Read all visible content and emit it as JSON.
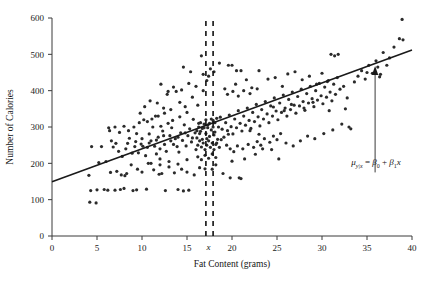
{
  "chart_data": {
    "type": "scatter",
    "title": "",
    "xlabel": "Fat Content (grams)",
    "ylabel": "Number of Calories",
    "xlim": [
      0,
      40
    ],
    "ylim": [
      0,
      600
    ],
    "xticks": [
      0,
      5,
      10,
      15,
      20,
      25,
      30,
      35,
      40
    ],
    "yticks": [
      0,
      100,
      200,
      300,
      400,
      500,
      600
    ],
    "xtick_labels": [
      "0",
      "5",
      "10",
      "15",
      "20",
      "25",
      "30",
      "35",
      "40"
    ],
    "ytick_labels": [
      "0",
      "100",
      "200",
      "300",
      "400",
      "500",
      "600"
    ],
    "grid": false,
    "legend": "none",
    "marker_color": "#2b2b2b",
    "marker_size": 1.6,
    "line_color": "#1a1a1a",
    "regression_line": {
      "intercept": 149,
      "slope": 9.08,
      "x_start": 0,
      "x_end": 40,
      "y_start": 149,
      "y_end": 512
    },
    "annotations": [
      {
        "name": "mean-response-equation",
        "text": "μ",
        "sub1": "y|x",
        "eq": " = ",
        "beta0": "β",
        "beta0sub": "0",
        "plus": " + ",
        "beta1": "β",
        "beta1sub": "1",
        "xvar": "x",
        "x_data": 36.0,
        "y_data": 195
      },
      {
        "name": "x-value-label",
        "text": "x",
        "x_data": 17.5,
        "y_data": -30
      }
    ],
    "vertical_dashed_lines": [
      {
        "x": 17.1,
        "y_from": 0,
        "y_to": 600
      },
      {
        "x": 17.9,
        "y_from": 0,
        "y_to": 600
      }
    ],
    "arrow": {
      "x_data": 35.9,
      "y_from": 175,
      "y_to": 468
    },
    "points": [
      [
        4.2,
        93
      ],
      [
        4.9,
        91
      ],
      [
        4.3,
        125
      ],
      [
        5.0,
        127
      ],
      [
        4.1,
        167
      ],
      [
        4.4,
        246
      ],
      [
        5.2,
        202
      ],
      [
        5.5,
        246
      ],
      [
        6.0,
        205
      ],
      [
        6.3,
        298
      ],
      [
        6.6,
        262
      ],
      [
        6.8,
        245
      ],
      [
        7.1,
        255
      ],
      [
        7.0,
        126
      ],
      [
        7.6,
        128
      ],
      [
        8.0,
        131
      ],
      [
        7.4,
        233
      ],
      [
        7.8,
        219
      ],
      [
        8.2,
        240
      ],
      [
        8.4,
        255
      ],
      [
        8.6,
        269
      ],
      [
        8.9,
        228
      ],
      [
        9.2,
        246
      ],
      [
        9.4,
        282
      ],
      [
        9.6,
        229
      ],
      [
        9.9,
        253
      ],
      [
        10.1,
        247
      ],
      [
        10.4,
        221
      ],
      [
        10.2,
        320
      ],
      [
        10.6,
        244
      ],
      [
        10.8,
        281
      ],
      [
        11.0,
        262
      ],
      [
        11.2,
        300
      ],
      [
        11.4,
        247
      ],
      [
        11.6,
        226
      ],
      [
        11.8,
        272
      ],
      [
        12.0,
        240
      ],
      [
        12.1,
        302
      ],
      [
        12.3,
        289
      ],
      [
        12.5,
        252
      ],
      [
        12.7,
        233
      ],
      [
        12.9,
        310
      ],
      [
        13.1,
        276
      ],
      [
        13.3,
        298
      ],
      [
        13.5,
        252
      ],
      [
        13.7,
        268
      ],
      [
        13.9,
        246
      ],
      [
        14.1,
        231
      ],
      [
        14.3,
        284
      ],
      [
        14.5,
        263
      ],
      [
        14.7,
        306
      ],
      [
        14.9,
        248
      ],
      [
        15.1,
        276
      ],
      [
        15.3,
        295
      ],
      [
        15.5,
        259
      ],
      [
        15.7,
        321
      ],
      [
        15.9,
        284
      ],
      [
        16.1,
        270
      ],
      [
        16.3,
        310
      ],
      [
        16.5,
        288
      ],
      [
        16.7,
        266
      ],
      [
        16.9,
        298
      ],
      [
        17.1,
        282
      ],
      [
        17.3,
        305
      ],
      [
        17.5,
        274
      ],
      [
        17.7,
        292
      ],
      [
        17.9,
        318
      ],
      [
        18.1,
        286
      ],
      [
        18.3,
        256
      ],
      [
        18.5,
        300
      ],
      [
        18.7,
        327
      ],
      [
        18.9,
        294
      ],
      [
        19.1,
        272
      ],
      [
        19.3,
        312
      ],
      [
        19.5,
        290
      ],
      [
        19.7,
        333
      ],
      [
        19.9,
        301
      ],
      [
        20.1,
        281
      ],
      [
        20.3,
        322
      ],
      [
        20.5,
        298
      ],
      [
        20.7,
        345
      ],
      [
        20.9,
        310
      ],
      [
        21.1,
        289
      ],
      [
        21.3,
        330
      ],
      [
        21.5,
        305
      ],
      [
        21.7,
        352
      ],
      [
        21.9,
        318
      ],
      [
        22.1,
        296
      ],
      [
        22.3,
        340
      ],
      [
        22.5,
        315
      ],
      [
        22.7,
        362
      ],
      [
        22.9,
        328
      ],
      [
        23.1,
        303
      ],
      [
        23.3,
        348
      ],
      [
        23.5,
        322
      ],
      [
        23.7,
        370
      ],
      [
        23.9,
        336
      ],
      [
        24.1,
        312
      ],
      [
        24.3,
        358
      ],
      [
        24.5,
        330
      ],
      [
        24.7,
        380
      ],
      [
        24.9,
        344
      ],
      [
        25.1,
        320
      ],
      [
        25.3,
        366
      ],
      [
        25.5,
        340
      ],
      [
        25.7,
        388
      ],
      [
        25.9,
        352
      ],
      [
        26.1,
        330
      ],
      [
        26.3,
        376
      ],
      [
        26.5,
        348
      ],
      [
        26.7,
        396
      ],
      [
        26.9,
        360
      ],
      [
        27.1,
        338
      ],
      [
        27.3,
        384
      ],
      [
        27.5,
        358
      ],
      [
        27.7,
        404
      ],
      [
        27.9,
        370
      ],
      [
        28.1,
        346
      ],
      [
        28.3,
        392
      ],
      [
        28.5,
        366
      ],
      [
        28.7,
        412
      ],
      [
        28.9,
        378
      ],
      [
        29.1,
        356
      ],
      [
        29.3,
        400
      ],
      [
        29.5,
        374
      ],
      [
        29.7,
        420
      ],
      [
        29.9,
        386
      ],
      [
        30.1,
        364
      ],
      [
        30.3,
        410
      ],
      [
        30.5,
        382
      ],
      [
        30.7,
        428
      ],
      [
        30.9,
        396
      ],
      [
        31.1,
        372
      ],
      [
        31.3,
        418
      ],
      [
        31.5,
        390
      ],
      [
        31.7,
        436
      ],
      [
        32.0,
        404
      ],
      [
        32.4,
        412
      ],
      [
        32.8,
        380
      ],
      [
        33.2,
        295
      ],
      [
        33.6,
        424
      ],
      [
        34.0,
        440
      ],
      [
        34.4,
        455
      ],
      [
        34.8,
        432
      ],
      [
        35.2,
        470
      ],
      [
        35.6,
        448
      ],
      [
        36.0,
        482
      ],
      [
        36.4,
        438
      ],
      [
        36.8,
        505
      ],
      [
        37.2,
        470
      ],
      [
        38.0,
        520
      ],
      [
        38.6,
        543
      ],
      [
        38.9,
        596
      ],
      [
        39.0,
        540
      ],
      [
        12.4,
        352
      ],
      [
        11.7,
        366
      ],
      [
        10.9,
        372
      ],
      [
        13.2,
        348
      ],
      [
        14.8,
        356
      ],
      [
        9.8,
        338
      ],
      [
        12.8,
        390
      ],
      [
        14.2,
        368
      ],
      [
        15.6,
        382
      ],
      [
        16.2,
        360
      ],
      [
        13.8,
        398
      ],
      [
        11.5,
        330
      ],
      [
        10.3,
        356
      ],
      [
        16.8,
        400
      ],
      [
        17.2,
        428
      ],
      [
        17.4,
        440
      ],
      [
        17.6,
        460
      ],
      [
        16.6,
        496
      ],
      [
        18.0,
        452
      ],
      [
        18.6,
        476
      ],
      [
        19.2,
        405
      ],
      [
        19.6,
        470
      ],
      [
        20.4,
        418
      ],
      [
        21.0,
        455
      ],
      [
        21.6,
        430
      ],
      [
        22.2,
        408
      ],
      [
        23.0,
        455
      ],
      [
        24.0,
        432
      ],
      [
        24.8,
        436
      ],
      [
        25.6,
        412
      ],
      [
        26.2,
        446
      ],
      [
        27.0,
        452
      ],
      [
        27.8,
        430
      ],
      [
        28.6,
        440
      ],
      [
        29.4,
        418
      ],
      [
        30.0,
        448
      ],
      [
        30.6,
        425
      ],
      [
        31.0,
        500
      ],
      [
        31.4,
        496
      ],
      [
        31.8,
        500
      ],
      [
        6.5,
        175
      ],
      [
        7.2,
        178
      ],
      [
        8.1,
        166
      ],
      [
        8.8,
        196
      ],
      [
        9.5,
        184
      ],
      [
        10.0,
        176
      ],
      [
        10.7,
        200
      ],
      [
        11.3,
        182
      ],
      [
        12.2,
        172
      ],
      [
        13.0,
        190
      ],
      [
        13.6,
        174
      ],
      [
        14.4,
        184
      ],
      [
        15.0,
        176
      ],
      [
        15.8,
        168
      ],
      [
        16.4,
        188
      ],
      [
        17.0,
        185
      ],
      [
        17.8,
        184
      ],
      [
        18.2,
        196
      ],
      [
        19.0,
        172
      ],
      [
        20.0,
        206
      ],
      [
        20.8,
        160
      ],
      [
        21.4,
        212
      ],
      [
        22.6,
        225
      ],
      [
        23.4,
        240
      ],
      [
        24.4,
        238
      ],
      [
        25.2,
        212
      ],
      [
        26.0,
        256
      ],
      [
        26.8,
        248
      ],
      [
        27.6,
        262
      ],
      [
        28.4,
        275
      ],
      [
        29.2,
        268
      ],
      [
        30.2,
        282
      ],
      [
        31.2,
        292
      ],
      [
        32.2,
        308
      ],
      [
        5.8,
        128
      ],
      [
        6.2,
        126
      ],
      [
        9.0,
        125
      ],
      [
        9.4,
        127
      ],
      [
        10.5,
        129
      ],
      [
        12.6,
        125
      ],
      [
        14.0,
        128
      ],
      [
        14.6,
        124
      ],
      [
        15.2,
        126
      ],
      [
        7.7,
        168
      ],
      [
        8.3,
        172
      ],
      [
        11.9,
        170
      ],
      [
        12.0,
        196
      ],
      [
        16.0,
        238
      ],
      [
        16.2,
        250
      ],
      [
        16.4,
        262
      ],
      [
        16.6,
        245
      ],
      [
        16.8,
        256
      ],
      [
        17.0,
        238
      ],
      [
        17.2,
        250
      ],
      [
        17.4,
        262
      ],
      [
        17.6,
        244
      ],
      [
        17.8,
        256
      ],
      [
        18.0,
        238
      ],
      [
        18.2,
        252
      ],
      [
        18.4,
        266
      ],
      [
        18.6,
        244
      ],
      [
        16.1,
        290
      ],
      [
        16.3,
        300
      ],
      [
        16.5,
        312
      ],
      [
        16.7,
        296
      ],
      [
        16.9,
        308
      ],
      [
        17.1,
        320
      ],
      [
        17.3,
        298
      ],
      [
        17.5,
        310
      ],
      [
        17.7,
        322
      ],
      [
        17.9,
        300
      ],
      [
        18.1,
        312
      ],
      [
        18.3,
        324
      ],
      [
        16.2,
        218
      ],
      [
        16.6,
        210
      ],
      [
        17.0,
        222
      ],
      [
        17.4,
        214
      ],
      [
        17.8,
        226
      ],
      [
        18.2,
        216
      ],
      [
        10.6,
        315
      ],
      [
        11.1,
        322
      ],
      [
        11.8,
        330
      ],
      [
        12.5,
        338
      ],
      [
        13.4,
        318
      ],
      [
        14.2,
        328
      ],
      [
        15.0,
        340
      ],
      [
        9.1,
        300
      ],
      [
        9.7,
        312
      ],
      [
        8.5,
        290
      ],
      [
        8.0,
        302
      ],
      [
        7.5,
        285
      ],
      [
        7.0,
        300
      ],
      [
        6.4,
        290
      ],
      [
        19.4,
        250
      ],
      [
        19.8,
        240
      ],
      [
        20.2,
        232
      ],
      [
        20.6,
        248
      ],
      [
        21.2,
        240
      ],
      [
        21.8,
        252
      ],
      [
        22.4,
        244
      ],
      [
        22.8,
        260
      ],
      [
        23.2,
        250
      ],
      [
        23.6,
        268
      ],
      [
        24.2,
        258
      ],
      [
        24.6,
        275
      ],
      [
        25.0,
        265
      ],
      [
        25.4,
        282
      ],
      [
        12.1,
        418
      ],
      [
        12.9,
        398
      ],
      [
        13.5,
        410
      ],
      [
        14.4,
        402
      ],
      [
        15.2,
        420
      ],
      [
        16.0,
        412
      ],
      [
        19.5,
        390
      ],
      [
        20.1,
        398
      ],
      [
        20.7,
        385
      ],
      [
        21.3,
        400
      ],
      [
        22.0,
        392
      ],
      [
        22.8,
        405
      ],
      [
        9.3,
        260
      ],
      [
        10.0,
        268
      ],
      [
        10.8,
        256
      ],
      [
        11.6,
        264
      ],
      [
        12.4,
        276
      ],
      [
        13.2,
        262
      ],
      [
        14.0,
        272
      ],
      [
        14.8,
        284
      ],
      [
        15.6,
        270
      ],
      [
        16.4,
        282
      ],
      [
        17.2,
        268
      ],
      [
        18.0,
        278
      ],
      [
        18.8,
        265
      ],
      [
        19.6,
        280
      ],
      [
        20.0,
        470
      ],
      [
        20.5,
        455
      ],
      [
        19.8,
        160
      ],
      [
        21.0,
        158
      ],
      [
        22.0,
        290
      ],
      [
        23.0,
        280
      ],
      [
        35.0,
        450
      ],
      [
        36.5,
        445
      ],
      [
        37.5,
        490
      ],
      [
        36.2,
        465
      ],
      [
        14.6,
        465
      ],
      [
        15.4,
        452
      ],
      [
        16.8,
        445
      ],
      [
        11.0,
        200
      ],
      [
        12.0,
        212
      ],
      [
        13.0,
        205
      ],
      [
        14.0,
        198
      ],
      [
        15.0,
        210
      ],
      [
        24.6,
        355
      ],
      [
        25.8,
        345
      ],
      [
        26.6,
        362
      ],
      [
        28.0,
        352
      ],
      [
        29.0,
        368
      ],
      [
        30.8,
        345
      ],
      [
        32.6,
        350
      ],
      [
        33.0,
        300
      ]
    ]
  },
  "axes": {
    "x_axis_name": "x-axis",
    "y_axis_name": "y-axis"
  }
}
